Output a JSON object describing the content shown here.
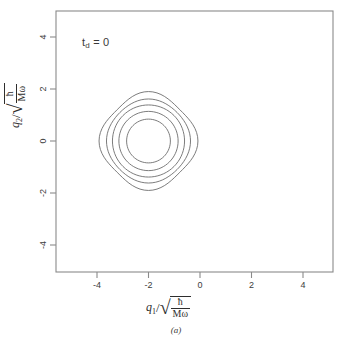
{
  "figure": {
    "panel_caption": "(a)",
    "annotation": {
      "symbol": "t",
      "subscript": "d",
      "equals_value": "= 0",
      "full_text": "t_d = 0"
    },
    "axes": {
      "x_title_var": "q",
      "x_title_sub": "1",
      "x_title_slash": "/",
      "y_title_var": "q",
      "y_title_sub": "2",
      "y_title_slash": "/",
      "radical_numerator": "ħ",
      "radical_denominator": "Mω",
      "sqrt_glyph": "√",
      "x_label_text": "q1/sqrt(hbar/M omega)",
      "y_label_text": "q2/sqrt(hbar/M omega)"
    }
  },
  "chart_data": {
    "type": "line",
    "subtype": "contour",
    "title": "",
    "xlabel": "q₁/√(ħ/Mω)",
    "ylabel": "q₂/√(ħ/Mω)",
    "annotation": "t_d = 0",
    "panel": "(a)",
    "grid": false,
    "legend": false,
    "xlim": [
      -5.6,
      5.2
    ],
    "ylim": [
      -4.5,
      5.0
    ],
    "xticks": [
      -4,
      -2,
      0,
      2,
      4
    ],
    "xtick_labels": [
      "-4",
      "-2",
      "0",
      "2",
      "4"
    ],
    "yticks": [
      4,
      2,
      0,
      -2,
      -4
    ],
    "ytick_labels": [
      "4",
      "2",
      "0",
      "-2",
      "-4"
    ],
    "center": [
      -2.0,
      0.0
    ],
    "contours": [
      {
        "level_index": 1,
        "radius": 0.85,
        "label": ""
      },
      {
        "level_index": 2,
        "radius": 1.15,
        "label": ""
      },
      {
        "level_index": 3,
        "radius": 1.4,
        "label": ""
      },
      {
        "level_index": 4,
        "radius": 1.6,
        "label": ""
      },
      {
        "level_index": 5,
        "radius": 1.82,
        "label": ""
      }
    ],
    "colors": {
      "contour_line": "#6d6d6d",
      "axis_frame": "#777777",
      "text": "#2e2e2e",
      "background": "#ffffff"
    }
  }
}
